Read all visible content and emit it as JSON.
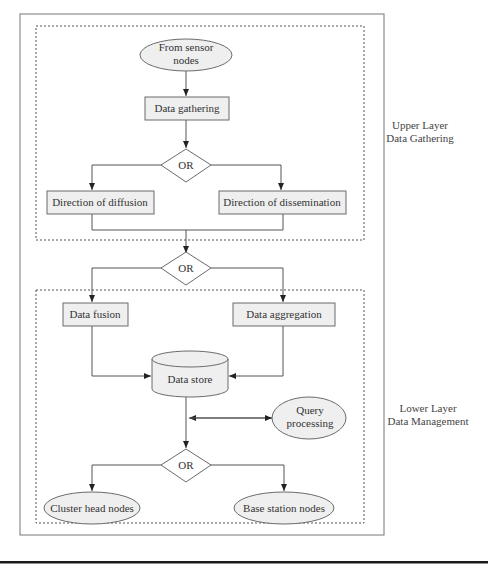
{
  "diagram": {
    "colors": {
      "stroke": "#6b6b6b",
      "node_fill": "#efefef",
      "text": "#333333",
      "bottom_rule": "#1a1a1a"
    },
    "layers": {
      "upper": {
        "line1": "Upper Layer",
        "line2": "Data Gathering"
      },
      "lower": {
        "line1": "Lower Layer",
        "line2": "Data Management"
      }
    },
    "nodes": {
      "from_sensor": {
        "line1": "From sensor",
        "line2": "nodes"
      },
      "data_gathering": "Data gathering",
      "or1": "OR",
      "diffusion": "Direction of diffusion",
      "dissemination": "Direction of dissemination",
      "or2": "OR",
      "data_fusion": "Data fusion",
      "data_aggregation": "Data aggregation",
      "data_store": "Data store",
      "query_processing": {
        "line1": "Query",
        "line2": "processing"
      },
      "or3": "OR",
      "cluster_head": "Cluster head nodes",
      "base_station": "Base station nodes"
    }
  }
}
